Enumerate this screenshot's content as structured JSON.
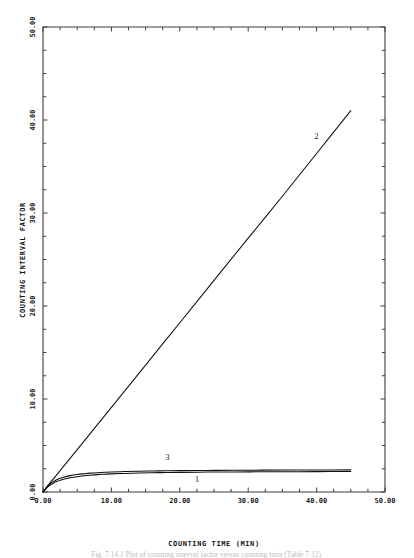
{
  "chart_data": {
    "type": "line",
    "title": "",
    "xlabel": "COUNTING TIME (MIN)",
    "ylabel": "COUNTING INTERVAL FACTOR",
    "xlim": [
      0,
      50
    ],
    "ylim": [
      0,
      50
    ],
    "grid": false,
    "legend": "inline-curve-labels",
    "x_tick_labels": [
      "0.00",
      "10.00",
      "20.00",
      "30.00",
      "40.00",
      "50.00"
    ],
    "x_tick_values": [
      0,
      10,
      20,
      30,
      40,
      50
    ],
    "y_tick_labels": [
      "0.00",
      "10.00",
      "20.00",
      "30.00",
      "40.00",
      "50.00"
    ],
    "y_tick_values": [
      0,
      10,
      20,
      30,
      40,
      50
    ],
    "minor_tick_interval": 2.5,
    "series": [
      {
        "name": "1",
        "label": "1",
        "label_x": 22.5,
        "label_y": 1.1,
        "x": [
          0,
          0.5,
          1,
          1.5,
          2,
          2.5,
          3,
          4,
          5,
          6,
          7,
          8,
          9,
          10,
          12,
          14,
          16,
          18,
          20,
          24,
          28,
          32,
          36,
          40,
          45
        ],
        "y": [
          0,
          0.42,
          0.72,
          0.95,
          1.12,
          1.26,
          1.37,
          1.53,
          1.65,
          1.74,
          1.81,
          1.87,
          1.91,
          1.95,
          2.0,
          2.04,
          2.07,
          2.09,
          2.11,
          2.14,
          2.16,
          2.17,
          2.18,
          2.19,
          2.2
        ]
      },
      {
        "name": "3",
        "label": "3",
        "label_x": 18.2,
        "label_y": 3.4,
        "x": [
          0,
          0.5,
          1,
          1.5,
          2,
          2.5,
          3,
          4,
          5,
          6,
          7,
          8,
          9,
          10,
          12,
          14,
          16,
          18,
          20,
          24,
          28,
          32,
          36,
          40,
          45
        ],
        "y": [
          0,
          0.5,
          0.86,
          1.12,
          1.32,
          1.47,
          1.59,
          1.76,
          1.88,
          1.96,
          2.03,
          2.08,
          2.12,
          2.15,
          2.2,
          2.24,
          2.26,
          2.28,
          2.3,
          2.32,
          2.34,
          2.35,
          2.36,
          2.37,
          2.38
        ]
      },
      {
        "name": "2",
        "label": "2",
        "label_x": 40.0,
        "label_y": 38.0,
        "x": [
          0,
          1,
          2,
          3,
          5,
          10,
          15,
          20,
          25,
          30,
          35,
          40,
          45
        ],
        "y": [
          0,
          0.95,
          1.85,
          2.75,
          4.55,
          9.1,
          13.65,
          18.2,
          22.75,
          27.3,
          31.8,
          36.4,
          41.0
        ]
      }
    ]
  },
  "caption": {
    "text": "Fig. 7.14.1 Plot of counting interval factor versus counting time (Table 7.12)."
  }
}
